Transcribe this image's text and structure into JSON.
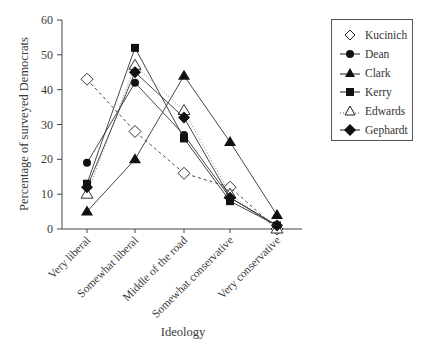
{
  "chart_data": {
    "type": "line",
    "title": "",
    "xlabel": "Ideology",
    "ylabel": "Percentage of surveyed Democrats",
    "ylim": [
      0,
      60
    ],
    "yticks": [
      0,
      10,
      20,
      30,
      40,
      50,
      60
    ],
    "grid": false,
    "legend_position": "upper right (outside plot)",
    "categories": [
      "Very liberal",
      "Somewhat liberal",
      "Middle of the road",
      "Somewhat conservative",
      "Very conservative"
    ],
    "series": [
      {
        "name": "Kucinich",
        "marker": "open-diamond",
        "line": "dashed",
        "values": [
          43,
          28,
          16,
          12,
          0
        ]
      },
      {
        "name": "Dean",
        "marker": "filled-circle",
        "line": "solid",
        "values": [
          19,
          42,
          27,
          9,
          1
        ]
      },
      {
        "name": "Clark",
        "marker": "filled-triangle",
        "line": "solid",
        "values": [
          5,
          20,
          44,
          25,
          4
        ]
      },
      {
        "name": "Kerry",
        "marker": "filled-square",
        "line": "solid",
        "values": [
          13,
          52,
          26,
          8,
          1
        ]
      },
      {
        "name": "Edwards",
        "marker": "open-triangle",
        "line": "dotted",
        "values": [
          10,
          47,
          34,
          10,
          0
        ]
      },
      {
        "name": "Gephardt",
        "marker": "filled-diamond",
        "line": "solid",
        "values": [
          12,
          45,
          32,
          9,
          1
        ]
      }
    ]
  },
  "legend": {
    "items": [
      "Kucinich",
      "Dean",
      "Clark",
      "Kerry",
      "Edwards",
      "Gephardt"
    ]
  }
}
